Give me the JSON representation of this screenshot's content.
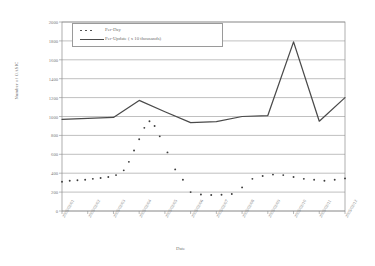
{
  "chart_data": {
    "type": "line",
    "title": "",
    "xlabel": "Date",
    "ylabel": "Number of OASIC",
    "ylim": [
      0,
      2000
    ],
    "ytick_step": 200,
    "grid": true,
    "legend_position": "top-left",
    "yticks": [
      "2000",
      "1800",
      "1600",
      "1400",
      "1200",
      "1000",
      "800",
      "600",
      "400",
      "200",
      "0"
    ],
    "categories": [
      "2005/02/01",
      "2005/02/02",
      "2005/02/03",
      "2005/02/04",
      "2005/02/05",
      "2005/02/06",
      "2005/02/07",
      "2005/02/08",
      "2005/02/09",
      "2005/02/10",
      "2005/02/11",
      "2005/02/12"
    ],
    "series": [
      {
        "name": "Per-Day",
        "style": "dotted",
        "color": "#3d3d3d",
        "x": [
          0,
          0.3,
          0.6,
          0.9,
          1.2,
          1.5,
          1.8,
          2.1,
          2.4,
          2.6,
          2.8,
          3.0,
          3.2,
          3.4,
          3.6,
          3.8,
          4.1,
          4.4,
          4.7,
          5.0,
          5.4,
          5.8,
          6.2,
          6.6,
          7.0,
          7.4,
          7.8,
          8.2,
          8.6,
          9.0,
          9.4,
          9.8,
          10.2,
          10.6,
          11.0
        ],
        "values": [
          310,
          320,
          325,
          330,
          340,
          350,
          360,
          380,
          430,
          520,
          640,
          760,
          880,
          950,
          900,
          790,
          620,
          440,
          330,
          200,
          175,
          170,
          172,
          180,
          250,
          340,
          370,
          385,
          380,
          360,
          340,
          330,
          320,
          330,
          345
        ]
      },
      {
        "name": "Per-Update ( x 10 thousands)",
        "style": "solid",
        "color": "#4a4a4a",
        "x": [
          0,
          1,
          2,
          3,
          4,
          5,
          6,
          7,
          8,
          9,
          10,
          11
        ],
        "values": [
          970,
          980,
          990,
          1170,
          1050,
          935,
          945,
          1000,
          1010,
          1790,
          950,
          1200
        ]
      }
    ]
  },
  "axis": {
    "y_title": "Number of OASIC",
    "x_title": "Date"
  },
  "legend": {
    "items": [
      {
        "label": "Per-Day",
        "marker": "dotted-line"
      },
      {
        "label": "Per-Update ( x 10 thousands)",
        "marker": "solid-line"
      }
    ]
  }
}
